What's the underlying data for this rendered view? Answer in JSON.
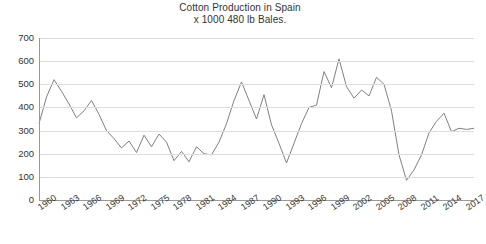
{
  "chart_data": {
    "type": "line",
    "title": "Cotton Production in Spain",
    "subtitle": "x 1000 480 lb Bales.",
    "xlabel": "",
    "ylabel": "",
    "ylim": [
      0,
      700
    ],
    "ytick_step": 100,
    "yticks": [
      700,
      600,
      500,
      400,
      300,
      200,
      100,
      0
    ],
    "grid": true,
    "legend": false,
    "xtick_step": 3,
    "xticks": [
      "1960",
      "1963",
      "1966",
      "1969",
      "1972",
      "1975",
      "1978",
      "1981",
      "1984",
      "1987",
      "1990",
      "1993",
      "1996",
      "1999",
      "2002",
      "2005",
      "2008",
      "2011",
      "2014",
      "2017"
    ],
    "x": [
      1960,
      1961,
      1962,
      1963,
      1964,
      1965,
      1966,
      1967,
      1968,
      1969,
      1970,
      1971,
      1972,
      1973,
      1974,
      1975,
      1976,
      1977,
      1978,
      1979,
      1980,
      1981,
      1982,
      1983,
      1984,
      1985,
      1986,
      1987,
      1988,
      1989,
      1990,
      1991,
      1992,
      1993,
      1994,
      1995,
      1996,
      1997,
      1998,
      1999,
      2000,
      2001,
      2002,
      2003,
      2004,
      2005,
      2006,
      2007,
      2008,
      2009,
      2010,
      2011,
      2012,
      2013,
      2014,
      2015,
      2016,
      2017,
      2018
    ],
    "values": [
      330,
      445,
      520,
      470,
      415,
      355,
      385,
      430,
      370,
      300,
      265,
      225,
      255,
      205,
      280,
      230,
      285,
      250,
      170,
      210,
      165,
      230,
      200,
      195,
      250,
      330,
      430,
      510,
      430,
      350,
      455,
      325,
      245,
      160,
      245,
      330,
      400,
      410,
      555,
      485,
      610,
      490,
      440,
      475,
      450,
      530,
      500,
      385,
      195,
      85,
      130,
      195,
      290,
      340,
      375,
      295,
      310,
      305,
      310
    ],
    "line_color": "#808080",
    "grid_color": "#dddddd",
    "axis_color": "#999999",
    "background": "#ffffff"
  }
}
